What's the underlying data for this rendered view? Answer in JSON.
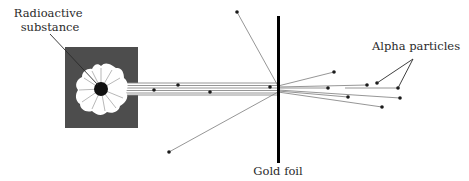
{
  "diagram": {
    "labels": {
      "source": [
        "Radioactive",
        "substance"
      ],
      "foil": "Gold foil",
      "particles": "Alpha particles"
    },
    "colors": {
      "box": "#4d4d4d",
      "burst": "#ffffff",
      "source_core": "#111111",
      "foil": "#000000",
      "beam": "#9a9a9a",
      "particle": "#1a1a1a"
    }
  }
}
